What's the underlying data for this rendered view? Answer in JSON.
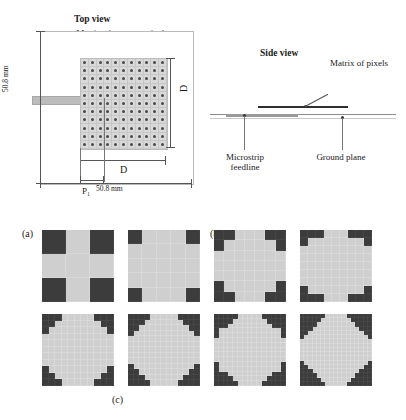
{
  "figure": {
    "caption_a": "(a)",
    "caption_b": "(b)",
    "caption_c": "(c)"
  },
  "panel_a": {
    "title": "Top view",
    "matrix_label": "Matrix of nₚₓ x nₚₓ pixels",
    "dim_substrate_width": "50.8 mm",
    "dim_substrate_height": "50.8 mm",
    "dim_patch_side_right": "D",
    "dim_patch_side_bottom": "D",
    "dim_pixel_pitch": "P₁",
    "colors": {
      "patch_fill": "#d8d8d8",
      "pixel_dot": "#4a4a4a",
      "feedline": "#bcbcbc",
      "substrate_border": "#b9b9b9"
    }
  },
  "panel_b": {
    "title": "Side view",
    "label_matrix": "Matrix of pixels",
    "label_feedline": "Microstrip feedline",
    "label_ground": "Ground plane",
    "colors": {
      "patch_layer": "#2e2e2e",
      "feed_layer": "#9a9a9a",
      "substrate_line": "#8d8d8d"
    }
  },
  "panel_c": {
    "description": "Corner-truncated pixelated patch geometries at increasing pixel resolution",
    "colors": {
      "metal": "#cfcfcf",
      "void": "#3c3c3c",
      "gridline": "#e2e2e2"
    },
    "patterns": [
      {
        "name": "pattern-1",
        "n": 3,
        "corner_steps": [
          1
        ]
      },
      {
        "name": "pattern-2",
        "n": 5,
        "corner_steps": [
          1
        ]
      },
      {
        "name": "pattern-3",
        "n": 7,
        "corner_steps": [
          2,
          1
        ]
      },
      {
        "name": "pattern-4",
        "n": 9,
        "corner_steps": [
          3,
          1
        ]
      },
      {
        "name": "pattern-5",
        "n": 11,
        "corner_steps": [
          3,
          2,
          1
        ]
      },
      {
        "name": "pattern-6",
        "n": 13,
        "corner_steps": [
          4,
          3,
          2,
          1
        ]
      },
      {
        "name": "pattern-7",
        "n": 15,
        "corner_steps": [
          5,
          4,
          3,
          1,
          1
        ]
      },
      {
        "name": "pattern-8",
        "n": 17,
        "corner_steps": [
          6,
          5,
          4,
          3,
          2,
          1
        ]
      }
    ]
  }
}
